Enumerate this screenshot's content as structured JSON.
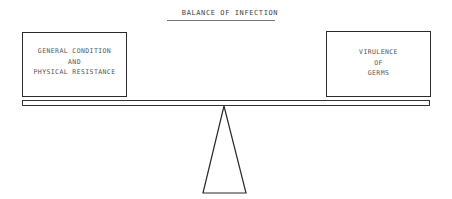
{
  "diagram": {
    "title": "BALANCE OF INFECTION",
    "left_pan": {
      "lines": [
        "GENERAL CONDITION",
        "AND",
        "PHYSICAL RESISTANCE"
      ]
    },
    "right_pan": {
      "lines": [
        "VIRULENCE",
        "OF",
        "GERMS"
      ]
    },
    "beam": "balance-beam",
    "fulcrum": "triangle-fulcrum",
    "colors": {
      "line": "#2a2a2a",
      "text": "#555555",
      "background": "#ffffff"
    }
  }
}
